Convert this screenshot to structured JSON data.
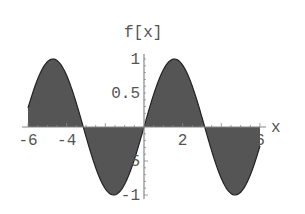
{
  "chart_data": {
    "type": "area",
    "title": "",
    "function": "sin(x)",
    "xlabel": "x",
    "ylabel": "f[x]",
    "xlim": [
      -6,
      6
    ],
    "ylim": [
      -1,
      1
    ],
    "grid": false,
    "legend": null,
    "fill": "to axis",
    "x_ticks": [
      -6,
      -4,
      -2,
      2,
      4,
      6
    ],
    "x_tick_labels": [
      "-6",
      "-4",
      "-2",
      "2",
      "4",
      "6"
    ],
    "y_ticks": [
      1,
      0.5,
      -0.5,
      -1
    ],
    "y_tick_labels": [
      "1",
      "0.5",
      "-0.5",
      "-1"
    ],
    "series": [
      {
        "name": "f[x]",
        "x": [
          -6,
          -5,
          -4.71,
          -4,
          -3.14,
          -2,
          -1.57,
          -1,
          0,
          1,
          1.57,
          2,
          3.14,
          4,
          4.71,
          5,
          6
        ],
        "values": [
          0.28,
          0.96,
          1.0,
          0.76,
          0.0,
          -0.91,
          -1.0,
          -0.84,
          0.0,
          0.84,
          1.0,
          0.91,
          0.0,
          -0.76,
          -1.0,
          -0.96,
          -0.28
        ]
      }
    ],
    "colors": {
      "fill": "#555555",
      "curve": "#222222",
      "axis": "#888888",
      "text": "#555555"
    }
  }
}
